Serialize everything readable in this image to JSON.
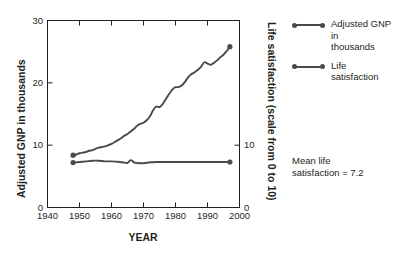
{
  "chart_data": {
    "type": "line",
    "title": "",
    "xlabel": "YEAR",
    "ylabel": "Adjusted GNP in thousands",
    "ylabel_right": "Life satisfaction (scale from 0 to 10)",
    "xlim": [
      1940,
      2000
    ],
    "ylim": [
      0,
      30
    ],
    "ylim_right": [
      0,
      30
    ],
    "grid": false,
    "legend_position": "right",
    "x_ticks": [
      "1940",
      "1950",
      "1960",
      "1970",
      "1980",
      "1990",
      "2000"
    ],
    "x_tick_values": [
      1940,
      1950,
      1960,
      1970,
      1980,
      1990,
      2000
    ],
    "y_ticks_left": [
      "0",
      "10",
      "20",
      "30"
    ],
    "y_tick_values_left": [
      0,
      10,
      20,
      30
    ],
    "y_ticks_right": [
      "0",
      "10"
    ],
    "y_tick_values_right": [
      0,
      10
    ],
    "series": [
      {
        "name": "Adjusted GNP in thousands",
        "color": "#4a4a4a",
        "marker_endpoints": true,
        "x": [
          1948,
          1949,
          1950,
          1951,
          1952,
          1953,
          1954,
          1955,
          1956,
          1957,
          1958,
          1959,
          1960,
          1961,
          1962,
          1963,
          1964,
          1965,
          1966,
          1967,
          1968,
          1969,
          1970,
          1971,
          1972,
          1973,
          1974,
          1975,
          1976,
          1977,
          1978,
          1979,
          1980,
          1981,
          1982,
          1983,
          1984,
          1985,
          1986,
          1987,
          1988,
          1989,
          1990,
          1991,
          1992,
          1993,
          1994,
          1995,
          1996,
          1997
        ],
        "y": [
          8.4,
          8.5,
          8.7,
          8.8,
          8.9,
          9.1,
          9.2,
          9.4,
          9.6,
          9.7,
          9.8,
          10.0,
          10.2,
          10.5,
          10.8,
          11.1,
          11.5,
          11.8,
          12.2,
          12.6,
          13.1,
          13.4,
          13.6,
          14.0,
          14.6,
          15.6,
          16.2,
          16.1,
          16.6,
          17.4,
          18.2,
          18.9,
          19.3,
          19.3,
          19.6,
          20.2,
          20.9,
          21.4,
          21.7,
          22.1,
          22.6,
          23.3,
          23.1,
          22.9,
          23.2,
          23.6,
          24.1,
          24.5,
          25.1,
          25.8
        ]
      },
      {
        "name": "Life satisfaction",
        "color": "#4a4a4a",
        "marker_endpoints": true,
        "x": [
          1948,
          1950,
          1952,
          1954,
          1956,
          1958,
          1960,
          1962,
          1964,
          1965,
          1966,
          1967,
          1968,
          1970,
          1972,
          1974,
          1976,
          1978,
          1980,
          1982,
          1984,
          1986,
          1988,
          1990,
          1992,
          1994,
          1997
        ],
        "y": [
          7.2,
          7.3,
          7.4,
          7.5,
          7.5,
          7.4,
          7.4,
          7.35,
          7.2,
          7.15,
          7.6,
          7.25,
          7.15,
          7.1,
          7.25,
          7.3,
          7.3,
          7.3,
          7.3,
          7.3,
          7.3,
          7.3,
          7.3,
          7.3,
          7.3,
          7.3,
          7.3
        ]
      }
    ],
    "annotations": [
      {
        "line1": "Mean life",
        "line2": "satisfaction = 7.2"
      }
    ]
  },
  "legend": {
    "items": [
      {
        "label_line1": "Adjusted GNP in",
        "label_line2": "thousands"
      },
      {
        "label_line1": "Life satisfaction",
        "label_line2": ""
      }
    ]
  },
  "axes": {
    "x_title": "YEAR",
    "y_title_left": "Adjusted GNP in thousands",
    "y_title_right": "Life satisfaction (scale from 0 to 10)"
  },
  "colors": {
    "line": "#4a4a4a",
    "axis": "#231f20",
    "background": "#ffffff",
    "text": "#231f20"
  }
}
